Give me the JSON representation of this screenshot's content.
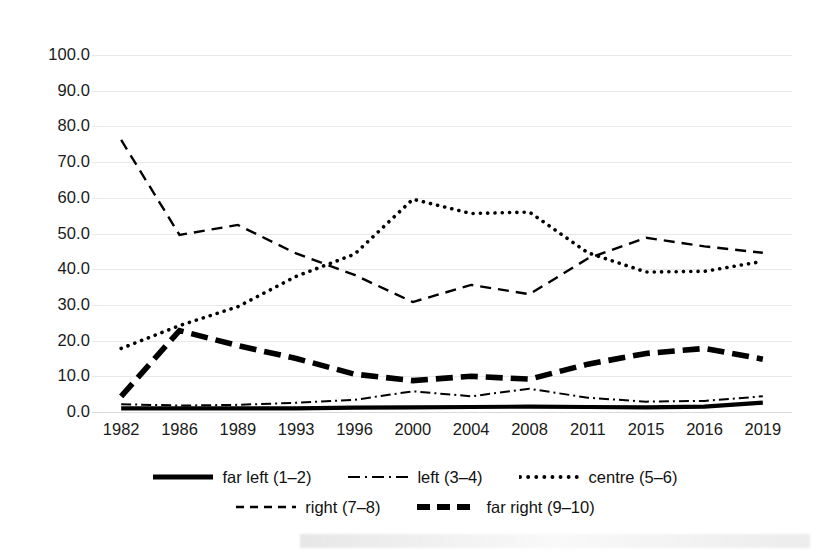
{
  "chart_data": {
    "type": "line",
    "title": "",
    "xlabel": "",
    "ylabel": "",
    "ylim": [
      0,
      100
    ],
    "ytick_step": 10,
    "grid": true,
    "legend_position": "bottom",
    "categories": [
      "1982",
      "1986",
      "1989",
      "1993",
      "1996",
      "2000",
      "2004",
      "2008",
      "2011",
      "2015",
      "2016",
      "2019"
    ],
    "yticks": [
      "0.0",
      "10.0",
      "20.0",
      "30.0",
      "40.0",
      "50.0",
      "60.0",
      "70.0",
      "80.0",
      "90.0",
      "100.0"
    ],
    "series": [
      {
        "name": "far left (1–2)",
        "key": "far-left",
        "style": "solid-thick",
        "values": [
          1.0,
          1.0,
          1.0,
          1.0,
          1.2,
          1.3,
          1.4,
          1.5,
          1.4,
          1.3,
          1.5,
          2.6
        ]
      },
      {
        "name": "left (3–4)",
        "key": "left",
        "style": "dash-dot",
        "values": [
          2.2,
          1.8,
          2.0,
          2.6,
          3.4,
          5.8,
          4.4,
          6.5,
          4.0,
          2.9,
          3.1,
          4.4
        ]
      },
      {
        "name": "centre (5–6)",
        "key": "centre",
        "style": "dotted",
        "values": [
          17.8,
          24.2,
          29.5,
          38.0,
          44.2,
          59.6,
          55.6,
          56.0,
          44.6,
          39.2,
          39.4,
          42.2
        ]
      },
      {
        "name": "right (7–8)",
        "key": "right",
        "style": "dashed",
        "values": [
          76.2,
          49.6,
          52.4,
          44.4,
          38.4,
          30.8,
          35.6,
          33.0,
          43.0,
          48.8,
          46.4,
          44.6
        ]
      },
      {
        "name": "far right (9–10)",
        "key": "far-right",
        "style": "dashed-thick",
        "values": [
          4.4,
          22.8,
          18.6,
          15.0,
          10.6,
          8.8,
          10.0,
          9.2,
          13.4,
          16.4,
          17.8,
          14.8
        ]
      }
    ]
  },
  "legend": {
    "rows": [
      [
        {
          "label": "far left (1–2)",
          "swatch": "solid-thick-swatch"
        },
        {
          "label": "left (3–4)",
          "swatch": "dash-dot-swatch"
        },
        {
          "label": "centre (5–6)",
          "swatch": "dotted-swatch"
        }
      ],
      [
        {
          "label": "right (7–8)",
          "swatch": "dashed-swatch"
        },
        {
          "label": "far right (9–10)",
          "swatch": "dashed-thick-swatch"
        }
      ]
    ]
  },
  "colors": {
    "line": "#000000",
    "grid": "#e8e8e8",
    "text": "#1a1a1a",
    "background": "#ffffff"
  }
}
